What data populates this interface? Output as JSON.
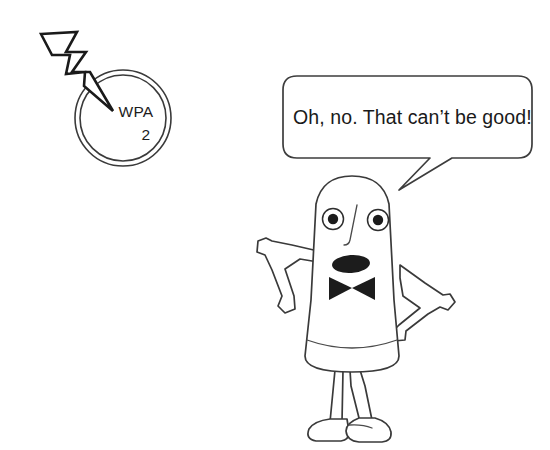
{
  "scene": {
    "title": "WPA2 security cartoon",
    "background_color": "#ffffff",
    "ink_color": "#3a3a3a",
    "accent_dark": "#1c1c1c",
    "width": 550,
    "height": 450
  },
  "security_badge": {
    "name": "wpa2-circle-badge",
    "protocol_label": "WPA",
    "version_label": "2",
    "center_x": 123,
    "center_y": 118,
    "outer_radius": 48,
    "inner_radius": 43
  },
  "lightning": {
    "name": "lightning-bolt",
    "description": "zigzag bolt striking the WPA2 badge",
    "stroke_color": "#1a1a1a",
    "origin_x": 40,
    "origin_y": 33,
    "tip_x": 113,
    "tip_y": 110
  },
  "speech_bubble": {
    "name": "speech-bubble",
    "text": "Oh, no. That can’t be good!",
    "x": 283,
    "y": 76,
    "width": 249,
    "height": 82,
    "corner_radius": 14,
    "tail_tip_x": 399,
    "tail_tip_y": 190
  },
  "character": {
    "name": "worried-blob-character",
    "parts": {
      "head_body": "rounded capsule torso",
      "eyes": 2,
      "nose": "single curved line",
      "mouth": "open dark oval",
      "bowtie": "two solid triangles",
      "arms": 2,
      "legs": 2,
      "shoes": 2
    },
    "left_eye": {
      "cx": 333,
      "cy": 219,
      "r": 10.5,
      "pupil_r": 5.2
    },
    "right_eye": {
      "cx": 378,
      "cy": 220,
      "r": 10.5,
      "pupil_r": 5.2
    },
    "mouth": {
      "cx": 351,
      "cy": 264,
      "rx": 19,
      "ry": 9
    },
    "bowtie": {
      "cx": 352,
      "cy": 288,
      "half_width": 23,
      "half_height": 13
    }
  }
}
